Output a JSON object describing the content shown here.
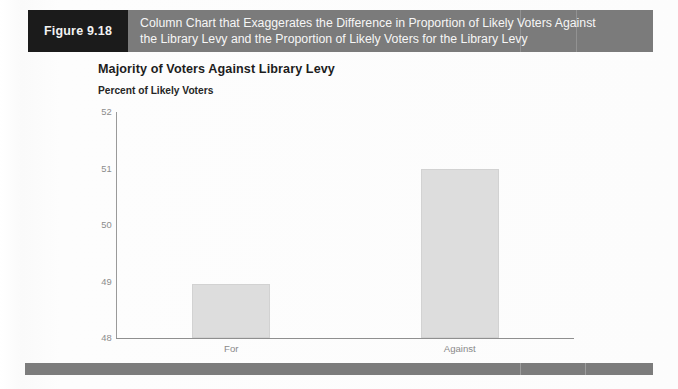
{
  "figure": {
    "number_label": "Figure 9.18",
    "caption_lines": [
      "Column Chart that Exaggerates the Difference in Proportion of Likely Voters Against",
      "the Library Levy and the Proportion of Likely Voters for the Library Levy"
    ]
  },
  "colors": {
    "figure_number_block": "#1b1b1b",
    "figure_caption_block": "#7b7b7b",
    "footer_bar": "#7c7c7c",
    "bar_fill": "#dddddd",
    "bar_border": "#d2d2d2",
    "axis_line": "#8f8f8f",
    "tick_text": "#8c8c8c",
    "title_text": "#1d1d1d",
    "page_background": "#fdfdfd"
  },
  "chart_data": {
    "type": "bar",
    "title": "Majority of Voters Against Library Levy",
    "subtitle": "Percent of Likely Voters",
    "xlabel": "",
    "ylabel": "Percent of Likely Voters",
    "categories": [
      "For",
      "Against"
    ],
    "values": [
      48.95,
      51.0
    ],
    "ylim": [
      48,
      52
    ],
    "yticks": [
      48,
      49,
      50,
      51,
      52
    ],
    "ytick_labels": [
      "48",
      "49",
      "50",
      "51",
      "52"
    ],
    "grid": false,
    "legend": false,
    "legend_position": "none",
    "annotations": [
      "Y axis is truncated, starting at 48 instead of 0, which exaggerates the difference between the two columns."
    ]
  }
}
